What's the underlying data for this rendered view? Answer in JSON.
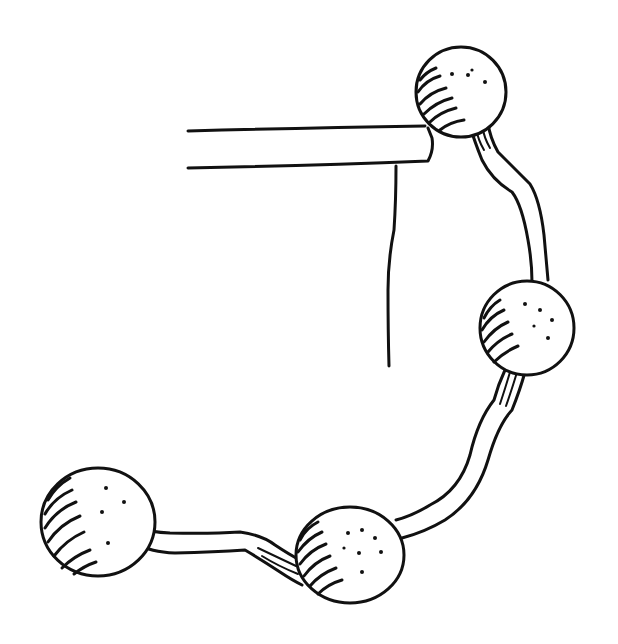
{
  "drawing": {
    "description": "Hand-drawn ink sketch of a chain of four shaded spheres connected by bent rods, attached to a horizontal bar with a vertical line",
    "ink_color": "#111111",
    "background": "#ffffff",
    "spheres": [
      {
        "id": "top",
        "cx": 461,
        "cy": 92,
        "r": 45
      },
      {
        "id": "middle-right",
        "cx": 527,
        "cy": 328,
        "r": 47
      },
      {
        "id": "bottom-middle",
        "cx": 350,
        "cy": 555,
        "r": 52
      },
      {
        "id": "bottom-left",
        "cx": 98,
        "cy": 522,
        "r": 56
      }
    ]
  }
}
